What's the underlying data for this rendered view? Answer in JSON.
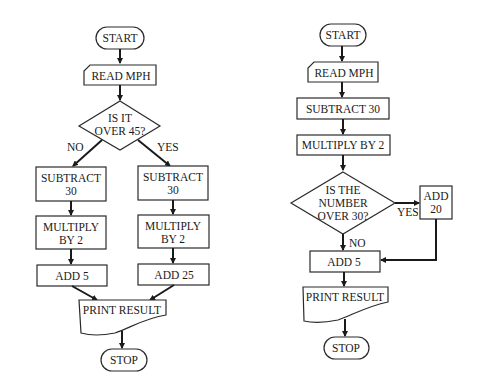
{
  "diagram": {
    "left_flowchart": {
      "start": "START",
      "read": "READ MPH",
      "decision": [
        "IS IT",
        "OVER 45?"
      ],
      "no_label": "NO",
      "yes_label": "YES",
      "no_branch": {
        "subtract": [
          "SUBTRACT",
          "30"
        ],
        "multiply": [
          "MULTIPLY",
          "BY 2"
        ],
        "add": "ADD 5"
      },
      "yes_branch": {
        "subtract": [
          "SUBTRACT",
          "30"
        ],
        "multiply": [
          "MULTIPLY",
          "BY 2"
        ],
        "add": "ADD 25"
      },
      "print": "PRINT RESULT",
      "stop": "STOP"
    },
    "right_flowchart": {
      "start": "START",
      "read": "READ MPH",
      "subtract": "SUBTRACT 30",
      "multiply": "MULTIPLY BY 2",
      "decision": [
        "IS THE",
        "NUMBER",
        "OVER 30?"
      ],
      "yes_label": "YES",
      "no_label": "NO",
      "yes_action": [
        "ADD",
        "20"
      ],
      "add": "ADD 5",
      "print": "PRINT RESULT",
      "stop": "STOP"
    }
  }
}
